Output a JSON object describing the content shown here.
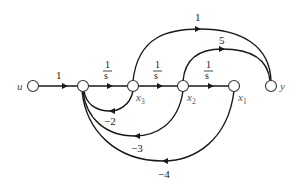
{
  "diagram": {
    "type": "signal-flow-graph",
    "nodes": {
      "u": {
        "label": "u",
        "x": 33,
        "y": 86
      },
      "n1": {
        "label": "",
        "x": 83,
        "y": 86
      },
      "x3": {
        "label": "x",
        "sub": "3",
        "x": 133,
        "y": 86
      },
      "x2": {
        "label": "x",
        "sub": "2",
        "x": 183,
        "y": 86
      },
      "x1": {
        "label": "x",
        "sub": "1",
        "x": 234,
        "y": 86
      },
      "y": {
        "label": "y",
        "x": 271,
        "y": 86
      }
    },
    "edges": {
      "u_n1": {
        "from": "u",
        "to": "n1",
        "gain": "1"
      },
      "n1_x3": {
        "from": "n1",
        "to": "x3",
        "gain_num": "1",
        "gain_den": "s"
      },
      "x3_x2": {
        "from": "x3",
        "to": "x2",
        "gain_num": "1",
        "gain_den": "s"
      },
      "x2_x1": {
        "from": "x2",
        "to": "x1",
        "gain_num": "1",
        "gain_den": "s"
      },
      "x3_y": {
        "from": "x3",
        "to": "y",
        "gain": "1"
      },
      "x2_y": {
        "from": "x2",
        "to": "y",
        "gain": "5"
      },
      "x3_n1": {
        "from": "x3",
        "to": "n1",
        "gain": "−2"
      },
      "x2_n1": {
        "from": "x2",
        "to": "n1",
        "gain": "−3"
      },
      "x1_n1": {
        "from": "x1",
        "to": "n1",
        "gain": "−4"
      }
    }
  }
}
